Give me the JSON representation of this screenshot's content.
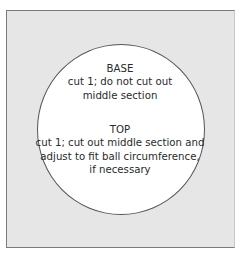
{
  "diagram": {
    "base": {
      "heading": "BASE",
      "lines": [
        "cut 1; do not cut out",
        "middle section"
      ]
    },
    "top": {
      "heading": "TOP",
      "lines": [
        "cut 1; cut out middle section and",
        "adjust to fit ball circumference,",
        "if necessary"
      ]
    }
  },
  "colors": {
    "panel_fill": "#e6e6e6",
    "circle_fill": "#ffffff",
    "outline": "#555555"
  }
}
